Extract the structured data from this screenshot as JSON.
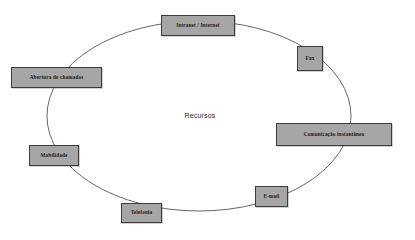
{
  "diagram": {
    "type": "cycle-ellipse",
    "center": {
      "label": "Recursos",
      "x": 200,
      "y": 117
    },
    "ellipse": {
      "cx": 199,
      "cy": 116,
      "rx": 152,
      "ry": 95,
      "stroke_color": "#555555",
      "fill": "none"
    },
    "node_style": {
      "fill_color": "#a6a6a6",
      "border_color": "#3b3b3b",
      "text_color": "#1a1a1a"
    },
    "nodes": [
      {
        "id": "intranet-internet",
        "label": "Intranet / Internet",
        "x": 161,
        "y": 15,
        "w": 74,
        "h": 21
      },
      {
        "id": "fax",
        "label": "Fax",
        "x": 297,
        "y": 46,
        "w": 26,
        "h": 25
      },
      {
        "id": "comunicacao-instantanea",
        "label": "Comunicação instantânea",
        "x": 276,
        "y": 123,
        "w": 116,
        "h": 23
      },
      {
        "id": "e-mail",
        "label": "E-mail",
        "x": 255,
        "y": 186,
        "w": 33,
        "h": 21
      },
      {
        "id": "telefonia",
        "label": "Telefonia",
        "x": 121,
        "y": 203,
        "w": 41,
        "h": 20
      },
      {
        "id": "mobilidade",
        "label": "Mobilidade",
        "x": 29,
        "y": 145,
        "w": 50,
        "h": 21
      },
      {
        "id": "abertura-de-chamados",
        "label": "Abertura de chamados",
        "x": 11,
        "y": 67,
        "w": 91,
        "h": 21
      }
    ]
  }
}
